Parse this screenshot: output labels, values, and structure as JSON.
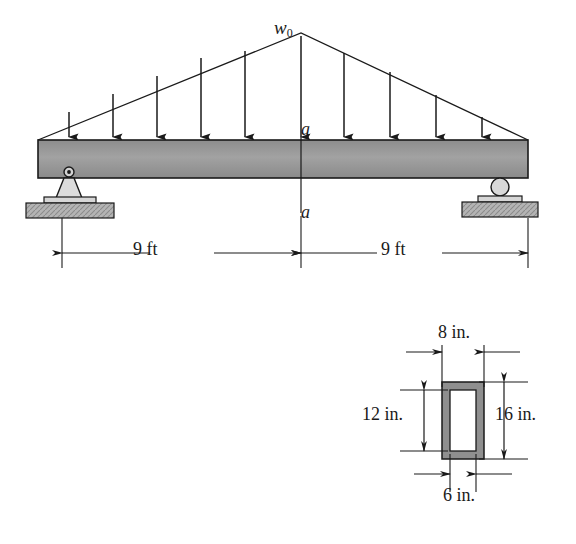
{
  "figure": {
    "colors": {
      "line": "#1a1a1a",
      "beam_fill": "#9a9a9a",
      "ground_fill": "#b0b0b0",
      "support_fill": "#d8d8d8",
      "section_fill": "#8f8f8f",
      "section_inner": "#ffffff"
    }
  },
  "beam_diagram": {
    "load_label": "w",
    "load_subscript": "0",
    "section_label_top": "a",
    "section_label_bottom": "a",
    "span_left_label": "9 ft",
    "span_right_label": "9 ft",
    "load_type": "triangular distributed load, peak at midspan",
    "arrow_count": 9,
    "support_left": "pin",
    "support_right": "roller"
  },
  "cross_section": {
    "shape": "hollow rectangular tube",
    "outer_width_label": "8 in.",
    "outer_height_label": "16 in.",
    "inner_width_label": "6 in.",
    "inner_height_label": "12 in."
  }
}
